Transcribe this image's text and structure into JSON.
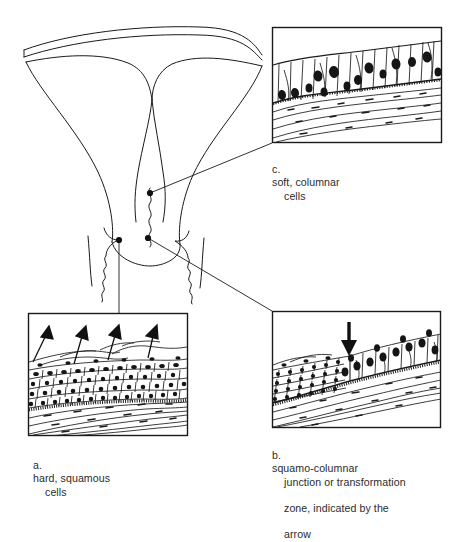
{
  "figure": {
    "background_color": "#ffffff",
    "line_color": "#1a1a1a",
    "anatomy_label": "uterus-and-cervix-cross-section"
  },
  "panels": [
    {
      "id": "a",
      "letter": "a.",
      "caption_line1": "hard, squamous",
      "caption_line2": "cells",
      "caption_full": "a. hard, squamous cells",
      "content": "stratified-squamous-epithelium-with-shedding-arrows",
      "arrow_count": 4,
      "arrow_direction": "up-outward",
      "box": {
        "x": 28,
        "y": 313,
        "width": 160,
        "height": 123
      },
      "marker_dot": {
        "x": 119,
        "y": 240
      }
    },
    {
      "id": "b",
      "letter": "b.",
      "caption_line1": "squamo-columnar",
      "caption_line2": "junction or transformation",
      "caption_line3": "zone, indicated by the",
      "caption_line4": "arrow",
      "caption_full": "b. squamo-columnar junction or transformation zone, indicated by the arrow",
      "content": "squamo-columnar-junction-with-down-arrow",
      "arrow_count": 1,
      "arrow_direction": "down",
      "box": {
        "x": 272,
        "y": 311,
        "width": 169,
        "height": 117
      },
      "marker_dot": {
        "x": 148,
        "y": 238
      }
    },
    {
      "id": "c",
      "letter": "c.",
      "caption_line1": "soft, columnar",
      "caption_line2": "cells",
      "caption_full": "c. soft, columnar cells",
      "content": "simple-columnar-epithelium",
      "arrow_count": 0,
      "box": {
        "x": 272,
        "y": 27,
        "width": 170,
        "height": 116
      },
      "marker_dot": {
        "x": 150,
        "y": 193
      }
    }
  ]
}
